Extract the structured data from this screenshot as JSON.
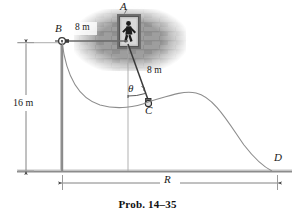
{
  "figure": {
    "caption": "Prob. 14–35",
    "labels": {
      "point_a": "A",
      "point_b": "B",
      "point_c": "C",
      "point_d": "D",
      "angle_theta": "θ",
      "range_r": "R"
    },
    "dimensions": {
      "horizontal_ab": "8 m",
      "rope_ac": "8 m",
      "height_16m": "16 m"
    },
    "colors": {
      "line": "#6e6e6e",
      "dark_line": "#2b2b2b",
      "ground": "#9a9a9a",
      "brick": "#8d8d8d",
      "brick_mortar": "#b9b9b9",
      "text": "#1a1a1a"
    },
    "icons": {
      "pulley": "pulley-icon",
      "person": "person-icon",
      "ball": "ball-icon",
      "wall": "brick-wall-icon"
    }
  }
}
